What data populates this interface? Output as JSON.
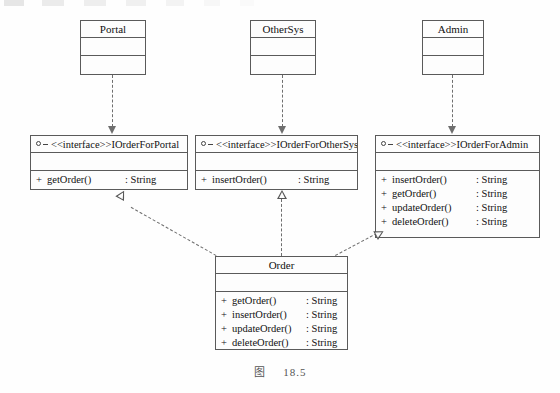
{
  "figure": {
    "caption_label": "图",
    "caption_number": "18.5",
    "diagram_type": "UML class diagram"
  },
  "colors": {
    "stroke": "#5a5a5a",
    "connector": "#6e6e6e",
    "text": "#111111",
    "background": "#fefefe"
  },
  "classes": [
    {
      "name": "Portal",
      "attributes": [],
      "operations": []
    },
    {
      "name": "OtherSys",
      "attributes": [],
      "operations": []
    },
    {
      "name": "Admin",
      "attributes": [],
      "operations": []
    }
  ],
  "order_class": {
    "name": "Order",
    "icon": "",
    "operations": [
      {
        "visibility": "+",
        "signature": "getOrder()",
        "type": ": String"
      },
      {
        "visibility": "+",
        "signature": "insertOrder()",
        "type": ": String"
      },
      {
        "visibility": "+",
        "signature": "updateOrder()",
        "type": ": String"
      },
      {
        "visibility": "+",
        "signature": "deleteOrder()",
        "type": ": String"
      }
    ]
  },
  "interfaces": [
    {
      "stereotype": "<<interface>>",
      "name": "IOrderForPortal",
      "icon": "interface-lollipop-icon",
      "operations": [
        {
          "visibility": "+",
          "signature": "getOrder()",
          "type": ": String"
        }
      ]
    },
    {
      "stereotype": "<<interface>>",
      "name": "IOrderForOtherSys",
      "icon": "interface-lollipop-icon",
      "operations": [
        {
          "visibility": "+",
          "signature": "insertOrder()",
          "type": ": String"
        }
      ]
    },
    {
      "stereotype": "<<interface>>",
      "name": "IOrderForAdmin",
      "icon": "interface-lollipop-icon",
      "operations": [
        {
          "visibility": "+",
          "signature": "insertOrder()",
          "type": ": String"
        },
        {
          "visibility": "+",
          "signature": "getOrder()",
          "type": ": String"
        },
        {
          "visibility": "+",
          "signature": "updateOrder()",
          "type": ": String"
        },
        {
          "visibility": "+",
          "signature": "deleteOrder()",
          "type": ": String"
        }
      ]
    }
  ],
  "relationships": {
    "dependencies": [
      {
        "from": "Portal",
        "to": "IOrderForPortal",
        "style": "dashed-open-arrow"
      },
      {
        "from": "OtherSys",
        "to": "IOrderForOtherSys",
        "style": "dashed-open-arrow"
      },
      {
        "from": "Admin",
        "to": "IOrderForAdmin",
        "style": "dashed-open-arrow"
      }
    ],
    "realizations": [
      {
        "from": "Order",
        "to": "IOrderForPortal",
        "style": "dashed-hollow-triangle"
      },
      {
        "from": "Order",
        "to": "IOrderForOtherSys",
        "style": "dashed-hollow-triangle"
      },
      {
        "from": "Order",
        "to": "IOrderForAdmin",
        "style": "dashed-hollow-triangle"
      }
    ]
  }
}
